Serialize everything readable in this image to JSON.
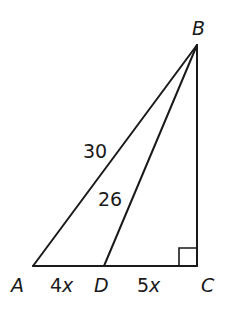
{
  "diagram": {
    "type": "right-triangle",
    "points": {
      "A": {
        "label": "A",
        "x": 33,
        "y": 266
      },
      "B": {
        "label": "B",
        "x": 197,
        "y": 45
      },
      "C": {
        "label": "C",
        "x": 197,
        "y": 266
      },
      "D": {
        "label": "D",
        "x": 104,
        "y": 266
      }
    },
    "segments": {
      "AB": {
        "label": "30"
      },
      "DB": {
        "label": "26"
      },
      "AD": {
        "label": "4x"
      },
      "DC": {
        "label": "5x"
      }
    },
    "right_angle_at": "C",
    "colors": {
      "stroke": "#1a1a1a",
      "background": "#ffffff"
    }
  }
}
